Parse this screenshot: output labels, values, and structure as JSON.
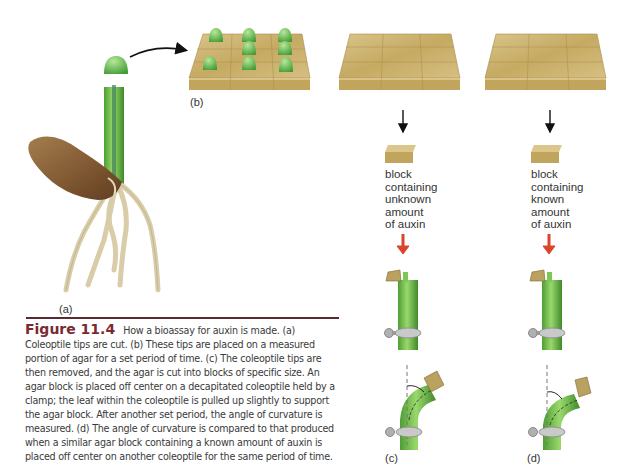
{
  "panels": {
    "a": {
      "label": "(a)"
    },
    "b": {
      "label": "(b)"
    },
    "c": {
      "label": "(c)",
      "block_text": [
        "block",
        "containing",
        "unknown",
        "amount",
        "of auxin"
      ]
    },
    "d": {
      "label": "(d)",
      "block_text": [
        "block",
        "containing",
        "known",
        "amount",
        "of auxin"
      ]
    }
  },
  "caption": {
    "figure_number": "Figure 11.4",
    "text": "How a bioassay for auxin is made. (a) Coleoptile tips are cut. (b) These tips are placed on a measured portion of agar for a set period of time. (c) The coleoptile tips are then removed, and the agar is cut into blocks of specific size. An agar block is placed off center on a decapitated coleoptile held by a clamp; the leaf within the coleoptile is pulled up slightly to support the agar block. After another set period, the angle of curvature is measured. (d) The angle of curvature is compared to that produced when a similar agar block containing a known amount of auxin is placed off center on another coleoptile for the same period of time."
  },
  "colors": {
    "agar": "#c9b06a",
    "coleoptile_green": "#6cbf4a",
    "seed_brown": "#8a6238",
    "root": "#ddd2b4",
    "red_arrow": "#d9452a",
    "figure_label": "#7a2a34",
    "rule": "#5a2a32"
  }
}
